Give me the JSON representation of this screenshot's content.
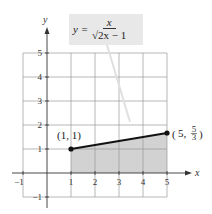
{
  "chart_data": {
    "type": "line",
    "title": "",
    "xlabel": "x",
    "ylabel": "y",
    "xlim": [
      -1,
      5
    ],
    "ylim": [
      -1,
      5
    ],
    "x_ticks": [
      -1,
      1,
      2,
      3,
      4,
      5
    ],
    "y_ticks": [
      -1,
      1,
      2,
      3,
      4,
      5
    ],
    "grid": true,
    "series": [
      {
        "name": "segment",
        "points": [
          [
            1,
            1
          ],
          [
            5,
            1.6667
          ]
        ]
      }
    ],
    "shaded_region": {
      "x_from": 1,
      "x_to": 5,
      "description": "region under segment down to x-axis"
    },
    "annotations": {
      "formula": {
        "lhs": "y =",
        "numerator": "x",
        "denominator": "√2x − 1"
      },
      "point_a_label": "(1, 1)",
      "point_b_label": "(5, 5/3)"
    }
  }
}
